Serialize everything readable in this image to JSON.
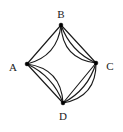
{
  "figure": {
    "kind": "undirected-multigraph",
    "background_color": "#ffffff",
    "stroke_color": "#1a1a1a",
    "label_color": "#1a1a1a",
    "vertex_color": "#000000",
    "total_vertices": 4,
    "total_edges": 11
  },
  "chart_data": {
    "type": "diagram",
    "title": "",
    "nodes": [
      {
        "id": "A",
        "label": "A",
        "x": 27,
        "y": 64,
        "label_x": 13,
        "label_y": 68,
        "label_anchor": "middle",
        "degree": 5
      },
      {
        "id": "B",
        "label": "B",
        "x": 61,
        "y": 25,
        "label_x": 61,
        "label_y": 15,
        "label_anchor": "middle",
        "degree": 5
      },
      {
        "id": "C",
        "label": "C",
        "x": 96,
        "y": 63,
        "label_x": 110,
        "label_y": 67,
        "label_anchor": "middle",
        "degree": 6
      },
      {
        "id": "D",
        "label": "D",
        "x": 63,
        "y": 103,
        "label_x": 63,
        "label_y": 117,
        "label_anchor": "middle",
        "degree": 6
      }
    ],
    "edges": [
      {
        "source": "A",
        "target": "B",
        "multiplicity": 2,
        "bows": [
          0,
          9
        ]
      },
      {
        "source": "B",
        "target": "C",
        "multiplicity": 3,
        "bows": [
          0,
          5.5,
          11
        ]
      },
      {
        "source": "A",
        "target": "D",
        "multiplicity": 3,
        "bows": [
          0,
          -5.5,
          -11
        ]
      },
      {
        "source": "C",
        "target": "D",
        "multiplicity": 3,
        "bows": [
          0,
          -5.5,
          -11
        ]
      }
    ],
    "edge_summary": [
      {
        "pair": "A-B",
        "count": 2
      },
      {
        "pair": "B-C",
        "count": 3
      },
      {
        "pair": "A-D",
        "count": 3
      },
      {
        "pair": "C-D",
        "count": 3
      }
    ]
  }
}
